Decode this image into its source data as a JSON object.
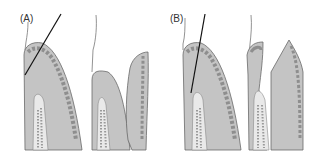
{
  "figure": {
    "panels": [
      {
        "id": "A",
        "label": "(A)"
      },
      {
        "id": "B",
        "label": "(B)"
      }
    ]
  },
  "colors": {
    "dentin": "#c4c4c4",
    "enamel_band": "#8e8e8e",
    "outline": "#6a6a6a",
    "pulp": "#e9e9e9",
    "pulp_texture": "#9a9a9a",
    "gingiva_line": "#777777",
    "reference_line": "#111111",
    "background": "#ffffff"
  }
}
